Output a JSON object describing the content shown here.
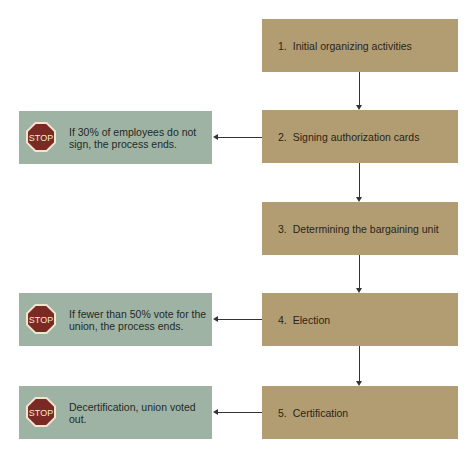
{
  "steps": [
    {
      "number": "1.",
      "label": "Initial organizing activities"
    },
    {
      "number": "2.",
      "label": "Signing authorization cards"
    },
    {
      "number": "3.",
      "label": "Determining the bargaining unit"
    },
    {
      "number": "4.",
      "label": "Election"
    },
    {
      "number": "5.",
      "label": "Certification"
    }
  ],
  "stops": [
    {
      "sign": "STOP",
      "text": "If 30% of employees do not sign, the process ends.",
      "from_step": 2
    },
    {
      "sign": "STOP",
      "text": "If fewer than 50% vote for the union, the process ends.",
      "from_step": 4
    },
    {
      "sign": "STOP",
      "text": "Decertification, union voted out.",
      "from_step": 5
    }
  ],
  "colors": {
    "step_fill": "#b29d72",
    "stop_fill": "#9fb3a5",
    "stop_sign": "#7a2a22",
    "arrow": "#333333"
  }
}
